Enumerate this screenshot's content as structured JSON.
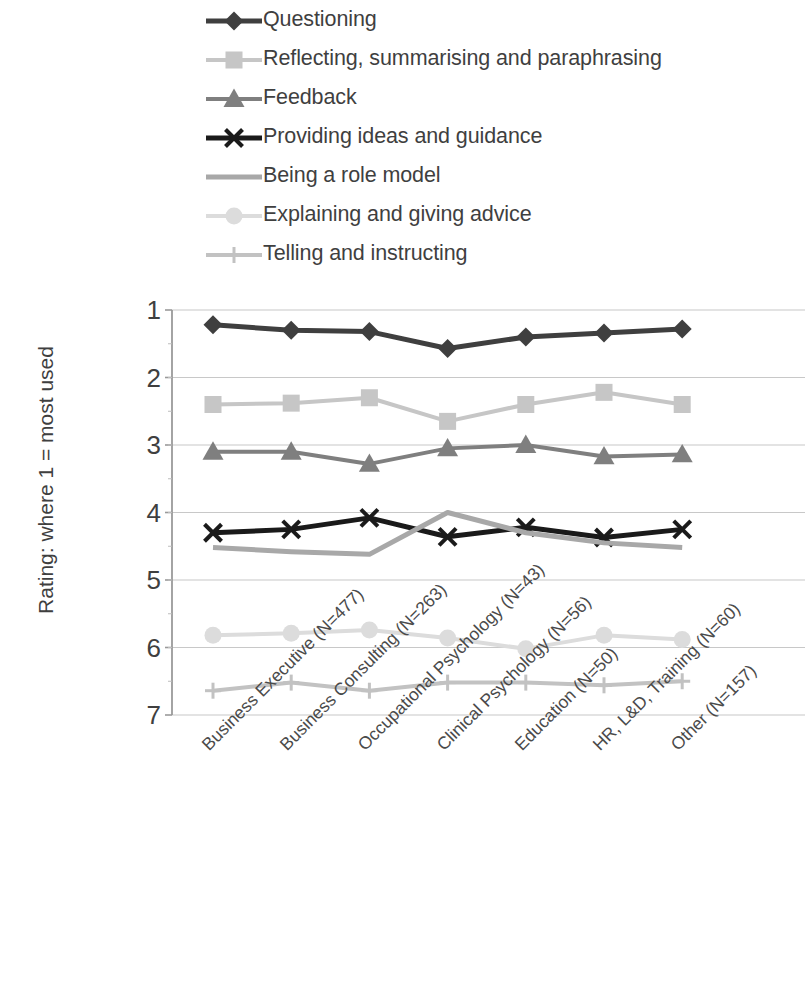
{
  "legend": {
    "position": "top",
    "items": [
      {
        "label": "Questioning",
        "marker": "diamond",
        "color": "#3f3f3f",
        "line_color": "#3f3f3f",
        "line_width": 5
      },
      {
        "label": "Reflecting, summarising and paraphrasing",
        "marker": "square",
        "color": "#c6c6c6",
        "line_color": "#c6c6c6",
        "line_width": 4
      },
      {
        "label": "Feedback",
        "marker": "triangle",
        "color": "#7f7f7f",
        "line_color": "#7f7f7f",
        "line_width": 4
      },
      {
        "label": "Providing ideas and guidance",
        "marker": "x",
        "color": "#1a1a1a",
        "line_color": "#1a1a1a",
        "line_width": 5
      },
      {
        "label": "Being a role model",
        "marker": "none",
        "color": "#a8a8a8",
        "line_color": "#a8a8a8",
        "line_width": 5
      },
      {
        "label": "Explaining and giving advice",
        "marker": "circle",
        "color": "#dcdcdc",
        "line_color": "#dcdcdc",
        "line_width": 4
      },
      {
        "label": "Telling and instructing",
        "marker": "plus",
        "color": "#c2c2c2",
        "line_color": "#c2c2c2",
        "line_width": 4
      }
    ]
  },
  "axes": {
    "y_title": "Rating: where 1 = most used",
    "y_ticks": [
      "1",
      "2",
      "3",
      "4",
      "5",
      "6",
      "7"
    ],
    "y_min": 1,
    "y_max": 7,
    "y_inverted": true,
    "x_ticks": [
      "Business Executive (N=477)",
      "Business Consulting (N=263)",
      "Occupational Psychology (N=43)",
      "Clinical Psychology (N=56)",
      "Education (N=50)",
      "HR, L&D, Training (N=60)",
      "Other (N=157)"
    ]
  },
  "chart_data": {
    "type": "line",
    "title": "",
    "xlabel": "",
    "ylabel": "Rating: where 1 = most used",
    "ylim": [
      1,
      7
    ],
    "y_inverted": true,
    "grid": true,
    "legend_position": "top",
    "categories": [
      "Business Executive (N=477)",
      "Business Consulting (N=263)",
      "Occupational Psychology (N=43)",
      "Clinical Psychology (N=56)",
      "Education (N=50)",
      "HR, L&D, Training (N=60)",
      "Other (N=157)"
    ],
    "series": [
      {
        "name": "Questioning",
        "marker": "diamond",
        "color": "#3f3f3f",
        "values": [
          1.22,
          1.3,
          1.32,
          1.57,
          1.4,
          1.34,
          1.28
        ]
      },
      {
        "name": "Reflecting, summarising and paraphrasing",
        "marker": "square",
        "color": "#c6c6c6",
        "values": [
          2.4,
          2.38,
          2.3,
          2.65,
          2.4,
          2.22,
          2.4
        ]
      },
      {
        "name": "Feedback",
        "marker": "triangle",
        "color": "#7f7f7f",
        "values": [
          3.1,
          3.1,
          3.28,
          3.05,
          3.0,
          3.17,
          3.14
        ]
      },
      {
        "name": "Providing ideas and guidance",
        "marker": "x",
        "color": "#1a1a1a",
        "values": [
          4.3,
          4.25,
          4.08,
          4.36,
          4.22,
          4.37,
          4.25
        ]
      },
      {
        "name": "Being a role model",
        "marker": "none",
        "color": "#a8a8a8",
        "values": [
          4.52,
          4.58,
          4.62,
          4.0,
          4.3,
          4.45,
          4.52
        ]
      },
      {
        "name": "Explaining and giving advice",
        "marker": "circle",
        "color": "#dcdcdc",
        "values": [
          5.82,
          5.79,
          5.74,
          5.86,
          6.02,
          5.82,
          5.88
        ]
      },
      {
        "name": "Telling and instructing",
        "marker": "plus",
        "color": "#c2c2c2",
        "values": [
          6.64,
          6.52,
          6.64,
          6.52,
          6.52,
          6.56,
          6.5
        ]
      }
    ]
  }
}
